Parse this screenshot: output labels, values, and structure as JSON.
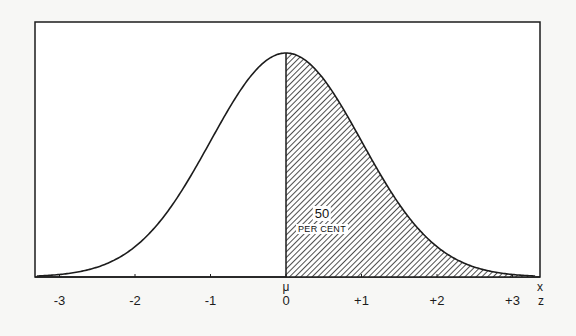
{
  "chart_data": {
    "type": "area",
    "title": "",
    "xlabel_top": "x",
    "xlabel_bottom": "z",
    "mean_label": "μ",
    "x_ticks": [
      -3,
      -2,
      -1,
      0,
      1,
      2,
      3
    ],
    "x_tick_labels": [
      "-3",
      "-2",
      "-1",
      "0",
      "+1",
      "+2",
      "+3"
    ],
    "xlim": [
      -3.3,
      3.4
    ],
    "shaded_region": {
      "from": 0,
      "to": 3.3,
      "fill": "diagonal-hatch"
    },
    "annotation": {
      "value": "50",
      "unit": "PER CENT"
    },
    "series": [
      {
        "name": "normal density",
        "x": [
          -3,
          -2.5,
          -2,
          -1.5,
          -1,
          -0.5,
          0,
          0.5,
          1,
          1.5,
          2,
          2.5,
          3
        ],
        "y": [
          0.0044,
          0.0175,
          0.054,
          0.1295,
          0.242,
          0.3521,
          0.3989,
          0.3521,
          0.242,
          0.1295,
          0.054,
          0.0175,
          0.0044
        ]
      }
    ],
    "grid": false,
    "legend": null
  },
  "colors": {
    "ink": "#1c1c1c",
    "paper": "#f7f7f5",
    "plot_bg": "#ffffff"
  }
}
